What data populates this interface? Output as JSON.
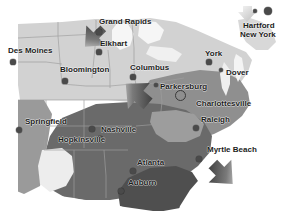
{
  "map": {
    "name": "eastern-united-states-grayscale-map",
    "width": 289,
    "height": 212,
    "background_color": "#ffffff",
    "land_light_color": "#d6d6d6",
    "land_mid_color": "#9a9a9a",
    "land_dark_color": "#6f6f6f",
    "land_darkest_color": "#4e4e4e",
    "water_color": "#f2f2f2",
    "border_line_color": "#8c8c8c",
    "dot_color": "#4a4a4a",
    "label_color": "#1c1c1c"
  },
  "cities": [
    {
      "name": "Des Moines",
      "label": "Des Moines",
      "label_x": 8,
      "label_y": 46,
      "dot_x": 13,
      "dot_y": 62,
      "dot_r": 2.6
    },
    {
      "name": "Grand Rapids",
      "label": "Grand Rapids",
      "label_x": 99,
      "label_y": 17,
      "dot_x": 99,
      "dot_y": 32,
      "dot_r": 2.6
    },
    {
      "name": "Elkhart",
      "label": "Elkhart",
      "label_x": 100,
      "label_y": 39,
      "dot_x": 99,
      "dot_y": 52,
      "dot_r": 2.6
    },
    {
      "name": "Bloomington",
      "label": "Bloomington",
      "label_x": 60,
      "label_y": 65,
      "dot_x": 65,
      "dot_y": 81,
      "dot_r": 2.6
    },
    {
      "name": "Columbus",
      "label": "Columbus",
      "label_x": 130,
      "label_y": 63,
      "dot_x": 133,
      "dot_y": 77,
      "dot_r": 2.6
    },
    {
      "name": "Parkersburg",
      "label": "Parkersburg",
      "label_x": 160,
      "label_y": 82,
      "dot_x": 156,
      "dot_y": 85,
      "dot_r": 2.0
    },
    {
      "name": "Hartford",
      "label": "Hartford",
      "label_x": 243,
      "label_y": 21,
      "dot_x": 255,
      "dot_y": 11,
      "dot_r": 2.2
    },
    {
      "name": "New York",
      "label": "New York",
      "label_x": 240,
      "label_y": 30,
      "dot_x": 268,
      "dot_y": 11,
      "dot_r": 4.2
    },
    {
      "name": "York",
      "label": "York",
      "label_x": 205,
      "label_y": 49,
      "dot_x": 209,
      "dot_y": 62,
      "dot_r": 2.6
    },
    {
      "name": "Dover",
      "label": "Dover",
      "label_x": 226,
      "label_y": 68,
      "dot_x": 221,
      "dot_y": 70,
      "dot_r": 2.2
    },
    {
      "name": "Charlottesville",
      "label": "Charlottesville",
      "label_x": 196,
      "label_y": 99,
      "dot_x": 179,
      "dot_y": 94,
      "dot_r": 0
    },
    {
      "name": "Raleigh",
      "label": "Raleigh",
      "label_x": 201,
      "label_y": 115,
      "dot_x": 196,
      "dot_y": 128,
      "dot_r": 3.0
    },
    {
      "name": "Myrtle Beach",
      "label": "Myrtle Beach",
      "label_x": 207,
      "label_y": 145,
      "dot_x": 199,
      "dot_y": 159,
      "dot_r": 3.0
    },
    {
      "name": "Springfield",
      "label": "Springfield",
      "label_x": 25,
      "label_y": 117,
      "dot_x": 19,
      "dot_y": 130,
      "dot_r": 3.0
    },
    {
      "name": "Nashville",
      "label": "Nashville",
      "label_x": 101,
      "label_y": 125,
      "dot_x": 92,
      "dot_y": 129,
      "dot_r": 3.0
    },
    {
      "name": "Hopkinsville",
      "label": "Hopkinsville",
      "label_x": 58,
      "label_y": 135,
      "dot_x": 100,
      "dot_y": 139,
      "dot_r": 2.6
    },
    {
      "name": "Atlanta",
      "label": "Atlanta",
      "label_x": 137,
      "label_y": 158,
      "dot_x": 133,
      "dot_y": 171,
      "dot_r": 3.0
    },
    {
      "name": "Auburn",
      "label": "Auburn",
      "label_x": 128,
      "label_y": 178,
      "dot_x": 121,
      "dot_y": 191,
      "dot_r": 3.0
    }
  ],
  "markers": [
    {
      "name": "selection-ring-charlottesville",
      "x": 179,
      "y": 94,
      "r": 4.5
    }
  ],
  "cursors": [
    {
      "name": "arrow-cursor-grand-rapids",
      "x": 74,
      "y": 19,
      "rotation": 45,
      "size": 26,
      "shade": "dark"
    },
    {
      "name": "arrow-cursor-ohio-valley",
      "x": 114,
      "y": 78,
      "rotation": 135,
      "size": 26,
      "shade": "dark"
    },
    {
      "name": "arrow-cursor-new-england",
      "x": 240,
      "y": 4,
      "rotation": 0,
      "size": 16,
      "shade": "light"
    },
    {
      "name": "arrow-cursor-myrtle-beach",
      "x": 203,
      "y": 157,
      "rotation": 315,
      "size": 26,
      "shade": "dark"
    }
  ]
}
